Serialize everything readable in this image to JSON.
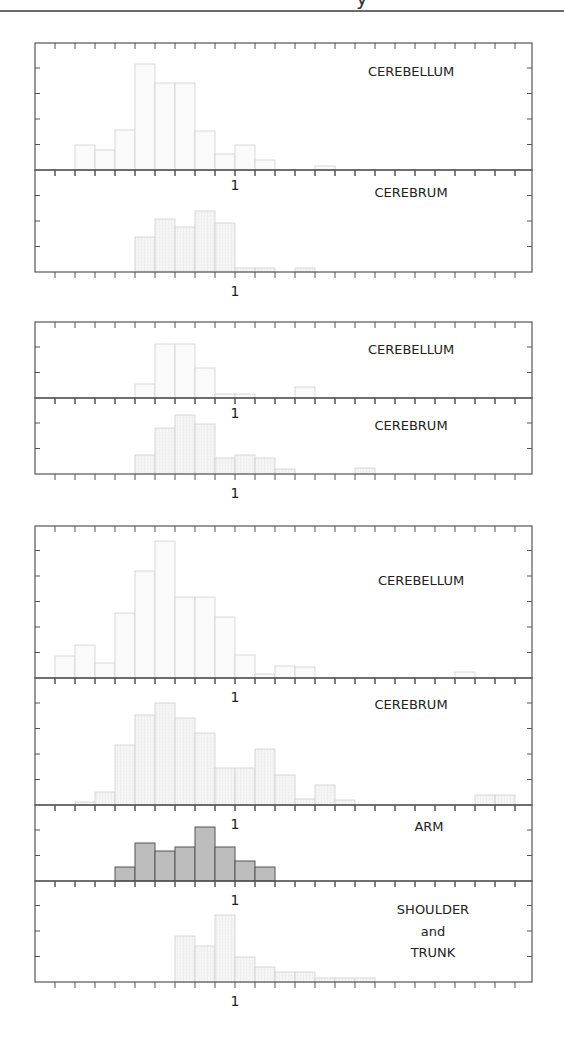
{
  "header": {
    "clipped_text": "y"
  },
  "layout": {
    "x_left": 35,
    "x_right": 532,
    "bin_width": 20,
    "x_origin": 35,
    "tick_start": 55,
    "tick_step": 20,
    "tick_count": 24,
    "ytick_step": 25.5,
    "one_label_x": 235
  },
  "colors": {
    "axis": "#555555",
    "bar_light_stroke": "#cfcfcf",
    "bar_light_fill": "#fafafa",
    "bar_hatched_fill": "#f1f1f1",
    "bar_dark_fill": "#bdbdbd",
    "bar_dark_stroke": "#555555",
    "label": "#222222"
  },
  "chart_data": [
    {
      "type": "bar",
      "group": 1,
      "title": "CEREBELLUM",
      "panel": {
        "top": 43,
        "bottom": 170
      },
      "style": "outline",
      "x_tick_label": "1",
      "bins": [
        [
          75,
          25
        ],
        [
          95,
          20
        ],
        [
          115,
          40
        ],
        [
          135,
          106
        ],
        [
          155,
          87
        ],
        [
          175,
          87
        ],
        [
          195,
          39
        ],
        [
          215,
          16
        ],
        [
          235,
          25
        ],
        [
          255,
          10
        ],
        [
          315,
          4
        ]
      ]
    },
    {
      "type": "bar",
      "group": 1,
      "title": "CEREBRUM",
      "panel": {
        "top": 170,
        "bottom": 272
      },
      "style": "hatched",
      "x_tick_label": "1",
      "bins": [
        [
          135,
          35
        ],
        [
          155,
          53
        ],
        [
          175,
          45
        ],
        [
          195,
          61
        ],
        [
          215,
          49
        ],
        [
          235,
          4
        ],
        [
          255,
          4
        ],
        [
          295,
          4
        ]
      ]
    },
    {
      "type": "bar",
      "group": 2,
      "title": "CEREBELLUM",
      "panel": {
        "top": 322,
        "bottom": 398
      },
      "style": "outline",
      "x_tick_label": "1",
      "bins": [
        [
          135,
          14
        ],
        [
          155,
          54
        ],
        [
          175,
          54
        ],
        [
          195,
          30
        ],
        [
          215,
          4
        ],
        [
          235,
          4
        ],
        [
          295,
          11
        ]
      ]
    },
    {
      "type": "bar",
      "group": 2,
      "title": "CEREBRUM",
      "panel": {
        "top": 398,
        "bottom": 474
      },
      "style": "hatched",
      "x_tick_label": "1",
      "bins": [
        [
          135,
          19
        ],
        [
          155,
          46
        ],
        [
          175,
          59
        ],
        [
          195,
          50
        ],
        [
          215,
          16
        ],
        [
          235,
          19
        ],
        [
          255,
          16
        ],
        [
          275,
          5
        ],
        [
          355,
          6
        ]
      ]
    },
    {
      "type": "bar",
      "group": 3,
      "title": "CEREBELLUM",
      "panel": {
        "top": 526,
        "bottom": 678
      },
      "style": "outline",
      "x_tick_label": "1",
      "bins": [
        [
          55,
          22
        ],
        [
          75,
          33
        ],
        [
          95,
          15
        ],
        [
          115,
          65
        ],
        [
          135,
          107
        ],
        [
          155,
          137
        ],
        [
          175,
          81
        ],
        [
          195,
          81
        ],
        [
          215,
          61
        ],
        [
          235,
          23
        ],
        [
          255,
          4
        ],
        [
          275,
          12
        ],
        [
          295,
          11
        ],
        [
          455,
          6
        ]
      ]
    },
    {
      "type": "bar",
      "group": 3,
      "title": "CEREBRUM",
      "panel": {
        "top": 678,
        "bottom": 805
      },
      "style": "hatched",
      "x_tick_label": "1",
      "bins": [
        [
          75,
          3
        ],
        [
          95,
          13
        ],
        [
          115,
          60
        ],
        [
          135,
          90
        ],
        [
          155,
          102
        ],
        [
          175,
          87
        ],
        [
          195,
          72
        ],
        [
          215,
          37
        ],
        [
          235,
          37
        ],
        [
          255,
          56
        ],
        [
          275,
          30
        ],
        [
          295,
          6
        ],
        [
          315,
          20
        ],
        [
          335,
          5
        ],
        [
          475,
          10
        ],
        [
          495,
          10
        ]
      ]
    },
    {
      "type": "bar",
      "group": 3,
      "title": "ARM",
      "panel": {
        "top": 805,
        "bottom": 881
      },
      "style": "dark",
      "x_tick_label": "1",
      "bins": [
        [
          115,
          14
        ],
        [
          135,
          38
        ],
        [
          155,
          30
        ],
        [
          175,
          34
        ],
        [
          195,
          54
        ],
        [
          215,
          34
        ],
        [
          235,
          20
        ],
        [
          255,
          14
        ]
      ]
    },
    {
      "type": "bar",
      "group": 3,
      "title": "SHOULDER and TRUNK",
      "title_lines": [
        "SHOULDER",
        "and",
        "TRUNK"
      ],
      "panel": {
        "top": 881,
        "bottom": 982
      },
      "style": "hatched",
      "x_tick_label": "1",
      "bins": [
        [
          175,
          46
        ],
        [
          195,
          36
        ],
        [
          215,
          67
        ],
        [
          235,
          25
        ],
        [
          255,
          15
        ],
        [
          275,
          10
        ],
        [
          295,
          10
        ],
        [
          315,
          4
        ],
        [
          335,
          4
        ],
        [
          355,
          4
        ]
      ]
    }
  ],
  "labels": [
    {
      "text": "CEREBELLUM",
      "x": 411,
      "y": 76
    },
    {
      "text": "1",
      "x": 235,
      "y": 190
    },
    {
      "text": "CEREBRUM",
      "x": 411,
      "y": 197
    },
    {
      "text": "1",
      "x": 235,
      "y": 296
    },
    {
      "text": "CEREBELLUM",
      "x": 411,
      "y": 354
    },
    {
      "text": "1",
      "x": 235,
      "y": 418
    },
    {
      "text": "CEREBRUM",
      "x": 411,
      "y": 430
    },
    {
      "text": "1",
      "x": 235,
      "y": 498
    },
    {
      "text": "CEREBELLUM",
      "x": 421,
      "y": 585
    },
    {
      "text": "1",
      "x": 235,
      "y": 702
    },
    {
      "text": "CEREBRUM",
      "x": 411,
      "y": 709
    },
    {
      "text": "1",
      "x": 235,
      "y": 829
    },
    {
      "text": "ARM",
      "x": 429,
      "y": 831
    },
    {
      "text": "1",
      "x": 235,
      "y": 905
    },
    {
      "text": "SHOULDER",
      "x": 433,
      "y": 914
    },
    {
      "text": "and",
      "x": 433,
      "y": 936
    },
    {
      "text": "TRUNK",
      "x": 433,
      "y": 957
    },
    {
      "text": "1",
      "x": 235,
      "y": 1006
    }
  ]
}
